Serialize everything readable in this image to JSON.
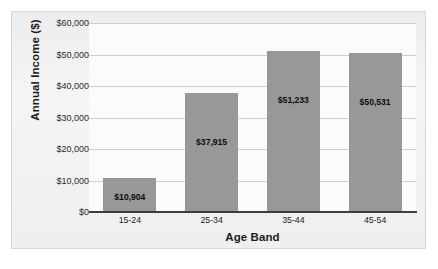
{
  "chart_data": {
    "type": "bar",
    "title": "",
    "xlabel": "Age Band",
    "ylabel": "Annual Income ($)",
    "categories": [
      "15-24",
      "25-34",
      "35-44",
      "45-54"
    ],
    "values": [
      10904,
      37915,
      51233,
      50531
    ],
    "value_labels": [
      "$10,904",
      "$37,915",
      "$51,233",
      "$50,531"
    ],
    "ylim": [
      0,
      60000
    ],
    "ytick_values": [
      0,
      10000,
      20000,
      30000,
      40000,
      50000,
      60000
    ],
    "ytick_labels": [
      "$0",
      "$10,000",
      "$20,000",
      "$30,000",
      "$40,000",
      "$50,000",
      "$60,000"
    ],
    "grid": true,
    "legend": false,
    "bar_color": "#989898",
    "axis_color": "#3d3d3d",
    "gridline_color": "#cfcfcf",
    "plot_background": "#fbfbfb",
    "frame_background": "#f1f1f1",
    "frame_border_color": "#d7d7d7"
  }
}
